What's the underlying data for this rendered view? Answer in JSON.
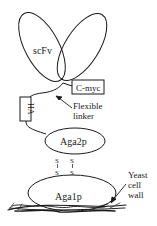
{
  "diagram": {
    "labels": {
      "scfv": "scFv",
      "cmyc": "C-myc",
      "ha": "HA",
      "flexible": "Flexible",
      "linker": "linker",
      "aga2p": "Aga2p",
      "aga1p": "Aga1p",
      "yeast": "Yeast",
      "cell": "cell",
      "wall": "wall",
      "s1_top": "S",
      "s1_bottom": "S",
      "s2_top": "S",
      "s2_bottom": "S"
    },
    "colors": {
      "stroke": "#1a1a1a",
      "background": "#ffffff"
    }
  }
}
